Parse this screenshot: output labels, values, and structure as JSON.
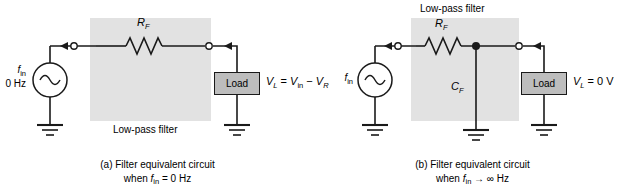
{
  "figure": {
    "type": "circuit-diagram-pair",
    "background_color": "#ffffff",
    "filter_box_color": "#e2e2e2",
    "load_box_color": "#bdbdbd",
    "line_color": "#1a1a1a"
  },
  "panel_a": {
    "id": "a",
    "filter_label": "Low-pass filter",
    "resistor_label": "R",
    "resistor_sub": "F",
    "source_label": "f",
    "source_sub": "in",
    "source_freq": "0 Hz",
    "load_label": "Load",
    "output_eq_v": "V",
    "output_eq_vsub": "L",
    "output_eq_mid": " = ",
    "output_eq_vin": "V",
    "output_eq_vinsub": "in",
    "output_eq_minus": " − ",
    "output_eq_vr": "V",
    "output_eq_vrsub": "R",
    "caption_line1": "(a) Filter equivalent circuit",
    "caption_line2_pre": "when ",
    "caption_line2_f": "f",
    "caption_line2_sub": "in",
    "caption_line2_post": " = 0 Hz"
  },
  "panel_b": {
    "id": "b",
    "filter_label": "Low-pass filter",
    "resistor_label": "R",
    "resistor_sub": "F",
    "capacitor_label": "C",
    "capacitor_sub": "F",
    "source_label": "f",
    "source_sub": "in",
    "load_label": "Load",
    "output_eq_v": "V",
    "output_eq_vsub": "L",
    "output_eq_rest": " = 0 V",
    "caption_line1": "(b) Filter equivalent circuit",
    "caption_line2_pre": "when ",
    "caption_line2_f": "f",
    "caption_line2_sub": "in",
    "caption_line2_post": " → ∞ Hz"
  }
}
